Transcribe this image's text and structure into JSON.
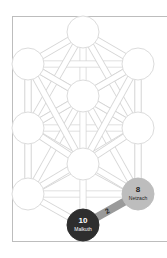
{
  "diagram": {
    "type": "tree-of-life",
    "colors": {
      "background": "#ffffff",
      "frame": "#bdbdbd",
      "path_stroke": "#d6d6d6",
      "node_fill": "#ffffff",
      "node_stroke": "#dcdcdc",
      "active_dark": "#2e2e2e",
      "active_light": "#bdbdbd",
      "active_path": "#9a9a9a"
    },
    "nodes": [
      {
        "id": 1,
        "cx": 83,
        "cy": 32,
        "label_num": "",
        "label_name": ""
      },
      {
        "id": 2,
        "cx": 138,
        "cy": 64,
        "label_num": "",
        "label_name": ""
      },
      {
        "id": 3,
        "cx": 28,
        "cy": 64,
        "label_num": "",
        "label_name": ""
      },
      {
        "id": 4,
        "cx": 138,
        "cy": 128,
        "label_num": "",
        "label_name": ""
      },
      {
        "id": 5,
        "cx": 28,
        "cy": 128,
        "label_num": "",
        "label_name": ""
      },
      {
        "id": 6,
        "cx": 83,
        "cy": 96,
        "label_num": "",
        "label_name": ""
      },
      {
        "id": 7,
        "cx": 28,
        "cy": 194,
        "label_num": "",
        "label_name": ""
      },
      {
        "id": 8,
        "cx": 138,
        "cy": 194,
        "label_num": "8",
        "label_name": "Netzach"
      },
      {
        "id": 9,
        "cx": 83,
        "cy": 164,
        "label_num": "",
        "label_name": ""
      },
      {
        "id": 10,
        "cx": 83,
        "cy": 225,
        "label_num": "10",
        "label_name": "Malkuth"
      }
    ],
    "active_path": {
      "from": 10,
      "to": 8,
      "label": "2"
    }
  }
}
